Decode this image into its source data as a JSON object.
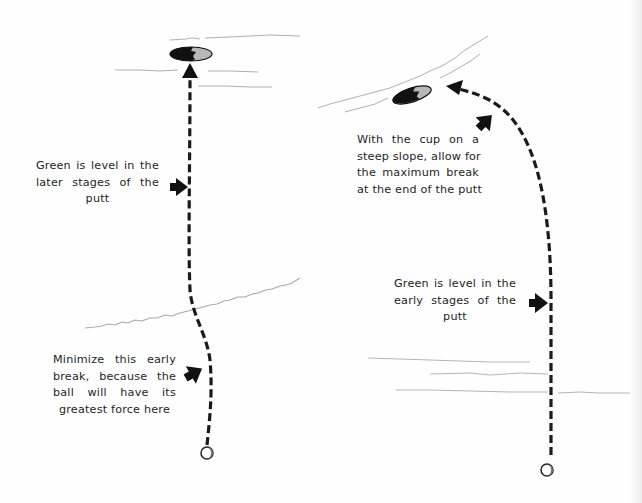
{
  "diagram": {
    "colors": {
      "path": "#1a1a1a",
      "arrow": "#111111",
      "contour": "#a8a8a8",
      "cup_dark": "#111111",
      "cup_light": "#b8b8b8",
      "text": "#1e1e1e",
      "background": "#fefefe"
    },
    "left_panel": {
      "name": "cup-on-level-green",
      "labels": [
        {
          "id": "level-later",
          "lines": [
            "Green is level in the",
            "later stages of the",
            "putt"
          ]
        },
        {
          "id": "minimize-early-break",
          "lines": [
            "Minimize this early",
            "break, because the",
            "ball will have its",
            "greatest force here"
          ]
        }
      ],
      "icons": [
        "cup-icon",
        "ball-icon",
        "pointer-arrow-icon",
        "pointer-arrow-icon",
        "dashed-path-arrow"
      ]
    },
    "right_panel": {
      "name": "cup-on-steep-slope",
      "labels": [
        {
          "id": "maximum-break",
          "lines": [
            "With the cup on a",
            "steep slope, allow for",
            "the maximum break",
            "at the end of the putt"
          ]
        },
        {
          "id": "level-early",
          "lines": [
            "Green is level in the",
            "early stages of the",
            "putt"
          ]
        }
      ],
      "icons": [
        "cup-icon",
        "ball-icon",
        "pointer-arrow-icon",
        "pointer-arrow-icon",
        "dashed-path-arrow"
      ]
    }
  }
}
